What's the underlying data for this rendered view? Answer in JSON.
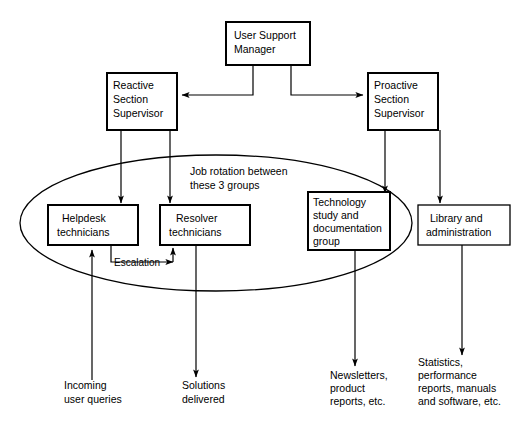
{
  "diagram": {
    "background_color": "#ffffff",
    "line_color": "#000000",
    "nodes": {
      "manager": {
        "label": "User Support\nManager",
        "line1": "User Support",
        "line2": "Manager"
      },
      "reactive_supervisor": {
        "line1": "Reactive",
        "line2": "Section",
        "line3": "Supervisor"
      },
      "proactive_supervisor": {
        "line1": "Proactive",
        "line2": "Section",
        "line3": "Supervisor"
      },
      "helpdesk": {
        "line1": "Helpdesk",
        "line2": "technicians"
      },
      "resolver": {
        "line1": "Resolver",
        "line2": "technicians"
      },
      "technology": {
        "line1": "Technology",
        "line2": "study and",
        "line3": "documentation",
        "line4": "group"
      },
      "library": {
        "line1": "Library and",
        "line2": "administration"
      }
    },
    "annotations": {
      "job_rotation": {
        "line1": "Job rotation between",
        "line2": "these 3 groups"
      },
      "escalation": {
        "label": "Escalation"
      }
    },
    "captions": {
      "incoming": {
        "line1": "Incoming",
        "line2": "user queries"
      },
      "solutions": {
        "line1": "Solutions",
        "line2": "delivered"
      },
      "newsletters": {
        "line1": "Newsletters,",
        "line2": "product",
        "line3": "reports, etc."
      },
      "statistics": {
        "line1": "Statistics,",
        "line2": "performance",
        "line3": "reports, manuals",
        "line4": "and software, etc."
      }
    }
  }
}
